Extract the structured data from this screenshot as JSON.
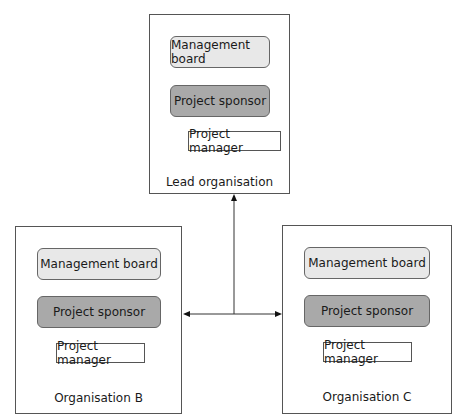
{
  "diagram": {
    "type": "organisational structure",
    "organisations": [
      {
        "id": "lead",
        "label": "Lead organisation",
        "boxes": {
          "board": "Management board",
          "sponsor": "Project sponsor",
          "manager": "Project manager"
        }
      },
      {
        "id": "b",
        "label": "Organisation B",
        "boxes": {
          "board": "Management board",
          "sponsor": "Project sponsor",
          "manager": "Project manager"
        }
      },
      {
        "id": "c",
        "label": "Organisation C",
        "boxes": {
          "board": "Management board",
          "sponsor": "Project sponsor",
          "manager": "Project manager"
        }
      }
    ],
    "connections": [
      {
        "from": "junction",
        "to": "lead",
        "arrow": "up"
      },
      {
        "from": "junction",
        "to": "b",
        "arrow": "left"
      },
      {
        "from": "junction",
        "to": "c",
        "arrow": "right"
      }
    ],
    "colors": {
      "board_fill": "#e8e8e8",
      "sponsor_fill": "#a9a9a9",
      "manager_fill": "#ffffff",
      "border": "#555555"
    }
  }
}
